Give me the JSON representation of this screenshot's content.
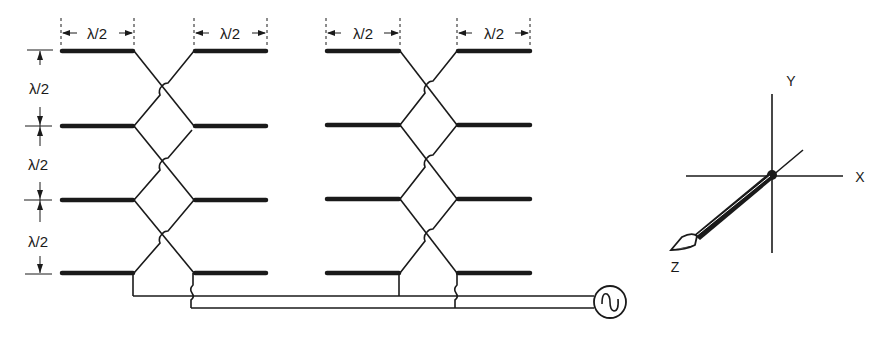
{
  "diagram": {
    "dimension_labels": {
      "top_left_left": "λ/2",
      "top_left_right": "λ/2",
      "top_right_left": "λ/2",
      "top_right_right": "λ/2",
      "vertical_1": "λ/2",
      "vertical_2": "λ/2",
      "vertical_3": "λ/2"
    },
    "bays": [
      {
        "name": "left-bay",
        "rows": 4
      },
      {
        "name": "right-bay",
        "rows": 4
      }
    ],
    "source": {
      "symbol": "~",
      "type": "ac-source"
    },
    "axes": {
      "x_label": "X",
      "y_label": "Y",
      "z_label": "Z"
    }
  }
}
